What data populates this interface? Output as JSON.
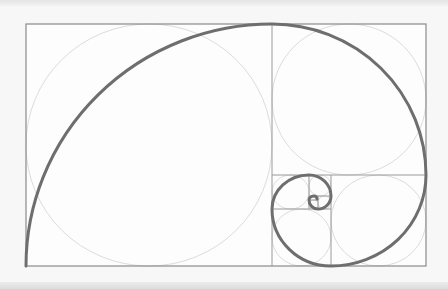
{
  "diagram": {
    "colors": {
      "background": "#f7f7f7",
      "panel": "#fdfdfd",
      "frame": "#8a8a8a",
      "grid": "#9a9a9a",
      "circle": "#dcdcdc",
      "spiral": "#6e6e6e"
    },
    "frame": {
      "x": 26,
      "y": 24,
      "width": 400,
      "height": 242
    },
    "squares": [
      {
        "name": "square-1",
        "x": 26,
        "y": 24,
        "w": 246,
        "h": 242
      },
      {
        "name": "square-2",
        "x": 272,
        "y": 24,
        "w": 154,
        "h": 151
      },
      {
        "name": "square-3",
        "x": 331,
        "y": 175,
        "w": 95,
        "h": 91
      },
      {
        "name": "square-4",
        "x": 272,
        "y": 209,
        "w": 59,
        "h": 57
      },
      {
        "name": "square-5",
        "x": 272,
        "y": 175,
        "w": 37,
        "h": 34
      },
      {
        "name": "square-6",
        "x": 309,
        "y": 175,
        "w": 22,
        "h": 21
      },
      {
        "name": "square-7",
        "x": 318,
        "y": 196,
        "w": 13,
        "h": 13
      },
      {
        "name": "square-8",
        "x": 309,
        "y": 200,
        "w": 9,
        "h": 9
      }
    ]
  }
}
